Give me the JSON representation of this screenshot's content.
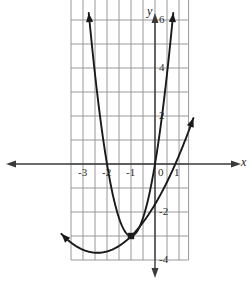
{
  "figure": {
    "width": 250,
    "height": 285,
    "background": "#ffffff",
    "grid_color": "#8c8c8c",
    "axis_color": "#3a3a3a",
    "curve_color": "#1a1a1a"
  },
  "axes": {
    "x_label": "x",
    "y_label": "y",
    "x_tick_labels": [
      "-3",
      "-2",
      "-1",
      "0",
      "1"
    ],
    "y_tick_labels": [
      "6",
      "4",
      "2",
      "-2",
      "-4"
    ]
  },
  "chart_data": {
    "type": "line",
    "title": "",
    "xlabel": "x",
    "ylabel": "y",
    "xlim": [
      -3.6,
      1.45
    ],
    "ylim": [
      -4.2,
      7.0
    ],
    "grid": true,
    "legend": null,
    "x_ticks": [
      -3,
      -2,
      -1,
      0,
      1
    ],
    "x_tick_labels": [
      "-3",
      "-2",
      "-1",
      "0",
      "1"
    ],
    "y_ticks": [
      6,
      4,
      2,
      -2,
      -4
    ],
    "y_tick_labels": [
      "6",
      "4",
      "2",
      "-2",
      "-4"
    ],
    "x_gridlines": [
      -3.5,
      -3,
      -2.5,
      -2,
      -1.5,
      -1,
      -0.5,
      0,
      0.5,
      1,
      1.4
    ],
    "y_gridlines": [
      -4,
      -3,
      -2,
      -1,
      0,
      1,
      2,
      3,
      4,
      5,
      6,
      6.9
    ],
    "series": [
      {
        "name": "narrow-upward-parabola",
        "equation": "y = 3(x + 1)^2 - 3",
        "vertex": [
          -1,
          -3
        ],
        "type": "parabola",
        "opens": "up",
        "arrow_start": true,
        "arrow_end": true,
        "x": [
          -3.45,
          -3.2,
          -3.0,
          -2.8,
          -2.6,
          -2.4,
          -2.2,
          -2.0,
          -1.8,
          -1.6,
          -1.4,
          -1.2,
          -1.0,
          -0.8,
          -0.6,
          -0.4,
          -0.2,
          0.0,
          0.2,
          0.4,
          0.6,
          0.75,
          0.9
        ],
        "y": [
          15.0,
          11.5,
          9.0,
          6.9,
          5.1,
          3.6,
          2.3,
          0.0,
          -1.1,
          -1.9,
          -2.5,
          -2.9,
          -3.0,
          -2.9,
          -2.5,
          -1.9,
          -1.1,
          0.0,
          1.3,
          2.9,
          4.7,
          6.2,
          7.8
        ]
      },
      {
        "name": "wide-upward-parabola",
        "equation": "y = 0.5(x + 2.4)^2 - 3.7",
        "vertex": [
          -2.4,
          -3.7
        ],
        "type": "parabola",
        "opens": "up",
        "arrow_start": true,
        "arrow_end": true,
        "x": [
          -5.9,
          -5.4,
          -4.9,
          -4.4,
          -3.9,
          -3.4,
          -2.9,
          -2.4,
          -1.9,
          -1.4,
          -0.9,
          -0.4,
          0.1,
          0.6,
          1.1,
          1.45
        ],
        "y": [
          2.4,
          0.8,
          -0.6,
          -1.7,
          -2.6,
          -3.2,
          -3.6,
          -3.7,
          -3.6,
          -3.2,
          -2.6,
          -1.7,
          -0.6,
          0.3,
          0.0,
          1.5
        ]
      }
    ],
    "points": [
      {
        "name": "intersection-point",
        "x": -1.0,
        "y": -3.0,
        "marker": "filled-square-dot"
      }
    ],
    "annotations": []
  }
}
